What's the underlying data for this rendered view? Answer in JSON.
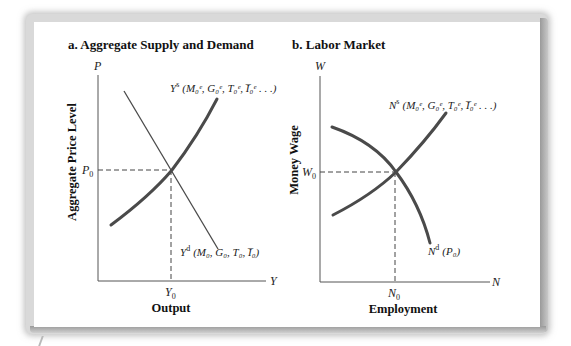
{
  "panels": {
    "a": {
      "title": "a.   Aggregate Supply and Demand",
      "y_axis_symbol": "P",
      "x_axis_symbol": "Y",
      "y_axis_label": "Aggregate Price Level",
      "x_axis_label": "Output",
      "equilibrium_y_label": "P",
      "equilibrium_y_sub": "0",
      "equilibrium_x_label": "Y",
      "equilibrium_x_sub": "0",
      "supply_curve_label": {
        "symbol": "Y",
        "sup": "s",
        "args": "(M₀ᵉ, G₀ᵉ, T₀ᵉ, I̅₀ᵉ . . .)"
      },
      "demand_curve_label": {
        "symbol": "Y",
        "sup": "d",
        "args": "(M₀, G₀, T₀, I̅₀)"
      }
    },
    "b": {
      "title": "b.   Labor Market",
      "y_axis_symbol": "W",
      "x_axis_symbol": "N",
      "y_axis_label": "Money Wage",
      "x_axis_label": "Employment",
      "equilibrium_y_label": "W",
      "equilibrium_y_sub": "0",
      "equilibrium_x_label": "N",
      "equilibrium_x_sub": "0",
      "supply_curve_label": {
        "symbol": "N",
        "sup": "s",
        "args": "(M₀ᵉ, G₀ᵉ, T₀ᵉ, I̅₀ᵉ . . .)"
      },
      "demand_curve_label": {
        "symbol": "N",
        "sup": "d",
        "args": "(P₀)"
      }
    }
  },
  "colors": {
    "curve": "#4a4a4a",
    "axis": "#555555",
    "text": "#111111",
    "frame_shadow": "#9a9a9a"
  }
}
